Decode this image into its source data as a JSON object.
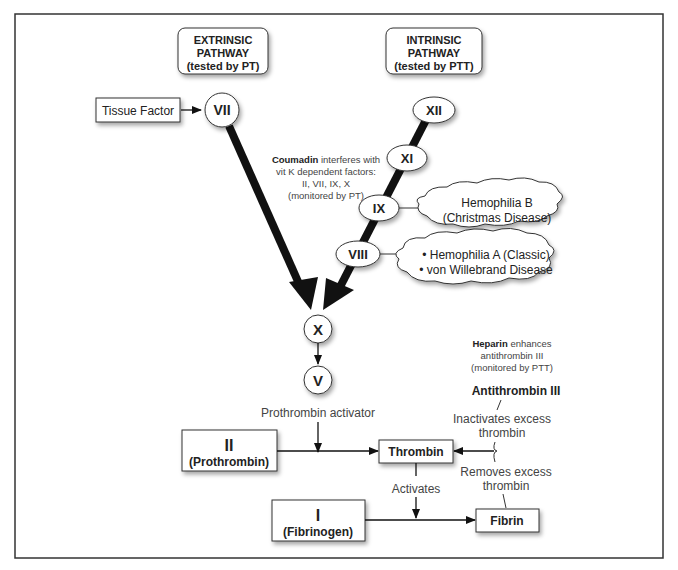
{
  "diagram": {
    "title_boxes": {
      "extrinsic": {
        "line1": "EXTRINSIC",
        "line2": "PATHWAY",
        "line3": "(tested by PT)"
      },
      "intrinsic": {
        "line1": "INTRINSIC",
        "line2": "PATHWAY",
        "line3": "(tested by PTT)"
      }
    },
    "tissue_factor": "Tissue Factor",
    "factors": {
      "vii": "VII",
      "xii": "XII",
      "xi": "XI",
      "ix": "IX",
      "viii": "VIII",
      "x": "X",
      "v": "V"
    },
    "coumadin_note": {
      "bold": "Coumadin",
      "line1_rest": " interferes with",
      "line2": "vit K dependent factors:",
      "line3": "II, VII, IX, X",
      "line4": "(monitored by PT)"
    },
    "clouds": {
      "hemophilia_b": {
        "line1": "Hemophilia B",
        "line2": "(Christmas Disease)"
      },
      "hemophilia_a": {
        "line1": "• Hemophilia A (Classic)",
        "line2": "• von Willebrand Disease"
      }
    },
    "heparin_note": {
      "bold": "Heparin",
      "line1_rest": " enhances",
      "line2": "antithrombin III",
      "line3": "(monitored by PTT)"
    },
    "antithrombin": "Antithrombin III",
    "inactivates": {
      "line1": "Inactivates excess",
      "line2": "thrombin"
    },
    "removes": {
      "line1": "Removes excess",
      "line2": "thrombin"
    },
    "prothrombin_activator": "Prothrombin activator",
    "prothrombin_box": {
      "numeral": "II",
      "name": "(Prothrombin)"
    },
    "thrombin": "Thrombin",
    "activates": "Activates",
    "fibrinogen_box": {
      "numeral": "I",
      "name": "(Fibrinogen)"
    },
    "fibrin": "Fibrin"
  }
}
